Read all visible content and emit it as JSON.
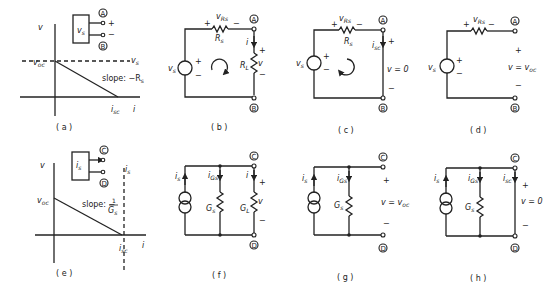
{
  "figure": {
    "panels": [
      {
        "id": "a",
        "caption": "( a )",
        "type": "v-i characteristic (voltage source)",
        "axis_v": "v",
        "axis_i": "i",
        "intercept_v": "v",
        "intercept_v_sub": "oc",
        "intercept_i": "i",
        "intercept_i_sub": "sc",
        "dashed_label": "v",
        "dashed_label_sub": "s",
        "slope_label": "slope: −R",
        "slope_label_sub": "s",
        "box_label": "v",
        "box_label_sub": "s",
        "terminal_top": "A",
        "terminal_bottom": "B",
        "plus": "+",
        "minus": "−"
      },
      {
        "id": "b",
        "caption": "( b )",
        "type": "voltage source with load",
        "source": "v",
        "source_sub": "s",
        "series_resistor": "R",
        "series_resistor_sub": "s",
        "resistor_voltage": "v",
        "resistor_voltage_sub": "Rs",
        "load": "R",
        "load_sub": "L",
        "current": "i",
        "voltage": "v",
        "terminal_top": "A",
        "terminal_bottom": "B",
        "plus": "+",
        "minus": "−"
      },
      {
        "id": "c",
        "caption": "( c )",
        "type": "voltage source short circuit",
        "source": "v",
        "source_sub": "s",
        "series_resistor": "R",
        "series_resistor_sub": "s",
        "resistor_voltage": "v",
        "resistor_voltage_sub": "Rs",
        "current": "i",
        "current_sub": "sc",
        "voltage_eq": "v = 0",
        "terminal_top": "A",
        "terminal_bottom": "B",
        "plus": "+",
        "minus": "−"
      },
      {
        "id": "d",
        "caption": "( d )",
        "type": "voltage source open circuit",
        "source": "v",
        "source_sub": "s",
        "resistor_voltage": "v",
        "resistor_voltage_sub": "Rs",
        "voltage_eq": "v = v",
        "voltage_eq_sub": "oc",
        "terminal_top": "A",
        "terminal_bottom": "B",
        "plus": "+",
        "minus": "−"
      },
      {
        "id": "e",
        "caption": "( e )",
        "type": "v-i characteristic (current source)",
        "axis_v": "v",
        "axis_i": "i",
        "intercept_v": "v",
        "intercept_v_sub": "oc",
        "intercept_i": "i",
        "intercept_i_sub": "sc",
        "dashed_label": "i",
        "dashed_label_sub": "s",
        "slope_label": "slope: −",
        "slope_num": "1",
        "slope_den": "G",
        "slope_den_sub": "s",
        "box_label": "i",
        "box_label_sub": "s",
        "terminal_top": "C",
        "terminal_bottom": "D"
      },
      {
        "id": "f",
        "caption": "( f )",
        "type": "current source with load",
        "source": "i",
        "source_sub": "s",
        "shunt_current": "i",
        "shunt_current_sub": "Gs",
        "shunt": "G",
        "shunt_sub": "s",
        "load": "G",
        "load_sub": "L",
        "current": "i",
        "voltage": "v",
        "terminal_top": "C",
        "terminal_bottom": "D",
        "plus": "+",
        "minus": "−"
      },
      {
        "id": "g",
        "caption": "( g )",
        "type": "current source open circuit",
        "source": "i",
        "source_sub": "s",
        "shunt_current": "i",
        "shunt_current_sub": "Gs",
        "shunt": "G",
        "shunt_sub": "s",
        "voltage_eq": "v = v",
        "voltage_eq_sub": "oc",
        "terminal_top": "C",
        "terminal_bottom": "D",
        "plus": "+",
        "minus": "−"
      },
      {
        "id": "h",
        "caption": "( h )",
        "type": "current source short circuit",
        "source": "i",
        "source_sub": "s",
        "shunt_current": "i",
        "shunt_current_sub": "Gs",
        "shunt": "G",
        "shunt_sub": "s",
        "current": "i",
        "current_sub": "sc",
        "voltage_eq": "v = 0",
        "terminal_top": "C",
        "terminal_bottom": "D",
        "plus": "+",
        "minus": "−"
      }
    ]
  }
}
